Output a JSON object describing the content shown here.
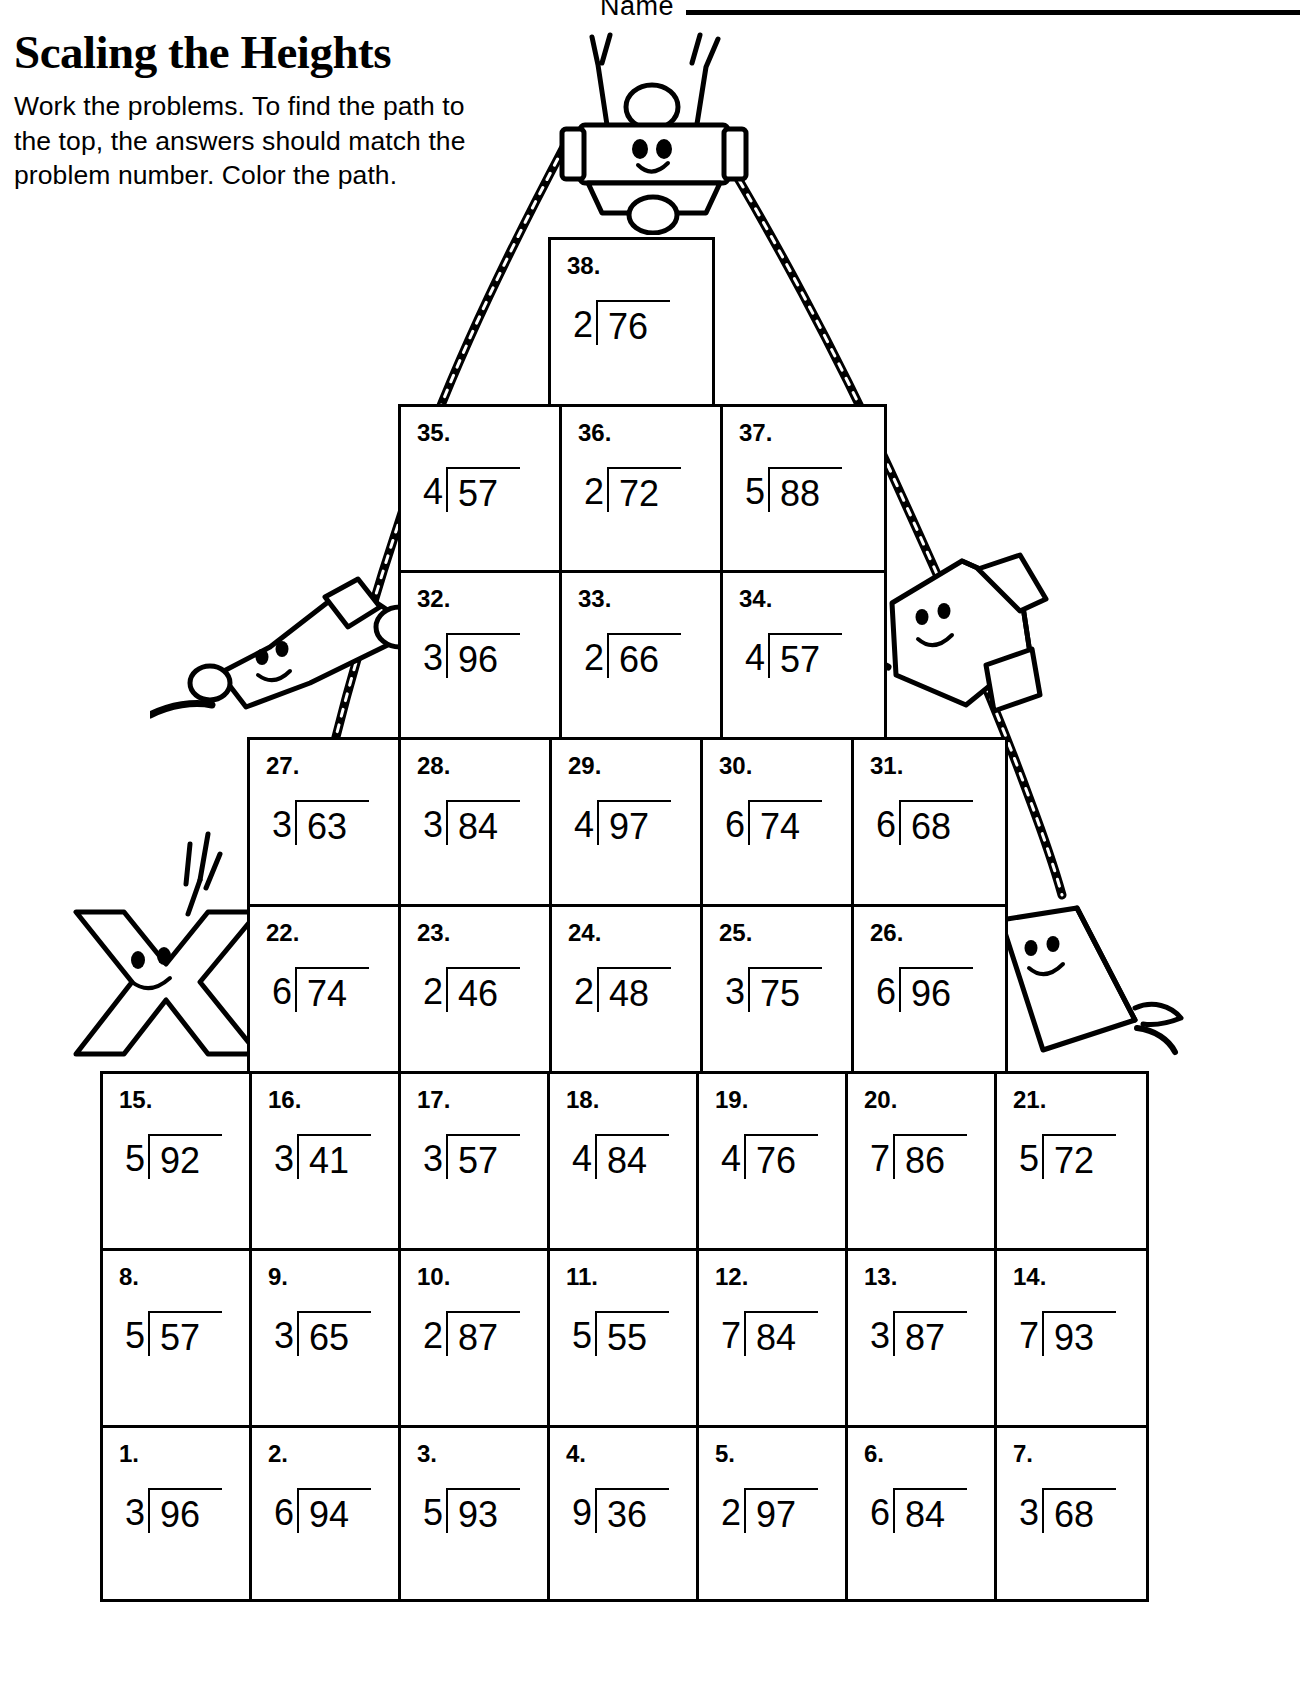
{
  "header": {
    "name_label": "Name",
    "title": "Scaling the Heights",
    "instructions": "Work the problems. To find the path to the top, the answers should match the problem number. Color the path."
  },
  "worksheet": {
    "rows": [
      {
        "id": "row-38",
        "left": 548,
        "top": 237,
        "cell_width": 161,
        "row_height": 172,
        "cells": [
          {
            "number": "38.",
            "divisor": "2",
            "dividend": "76"
          }
        ]
      },
      {
        "id": "row-35-37",
        "left": 398,
        "top": 404,
        "cell_width": 161,
        "row_height": 166,
        "cells": [
          {
            "number": "35.",
            "divisor": "4",
            "dividend": "57"
          },
          {
            "number": "36.",
            "divisor": "2",
            "dividend": "72"
          },
          {
            "number": "37.",
            "divisor": "5",
            "dividend": "88"
          }
        ]
      },
      {
        "id": "row-32-34",
        "left": 398,
        "top": 570,
        "cell_width": 161,
        "row_height": 167,
        "cells": [
          {
            "number": "32.",
            "divisor": "3",
            "dividend": "96"
          },
          {
            "number": "33.",
            "divisor": "2",
            "dividend": "66"
          },
          {
            "number": "34.",
            "divisor": "4",
            "dividend": "57"
          }
        ]
      },
      {
        "id": "row-27-31",
        "left": 247,
        "top": 737,
        "cell_width": 151,
        "row_height": 167,
        "cells": [
          {
            "number": "27.",
            "divisor": "3",
            "dividend": "63"
          },
          {
            "number": "28.",
            "divisor": "3",
            "dividend": "84"
          },
          {
            "number": "29.",
            "divisor": "4",
            "dividend": "97"
          },
          {
            "number": "30.",
            "divisor": "6",
            "dividend": "74"
          },
          {
            "number": "31.",
            "divisor": "6",
            "dividend": "68"
          }
        ]
      },
      {
        "id": "row-22-26",
        "left": 247,
        "top": 904,
        "cell_width": 151,
        "row_height": 167,
        "cells": [
          {
            "number": "22.",
            "divisor": "6",
            "dividend": "74"
          },
          {
            "number": "23.",
            "divisor": "2",
            "dividend": "46"
          },
          {
            "number": "24.",
            "divisor": "2",
            "dividend": "48"
          },
          {
            "number": "25.",
            "divisor": "3",
            "dividend": "75"
          },
          {
            "number": "26.",
            "divisor": "6",
            "dividend": "96"
          }
        ]
      },
      {
        "id": "row-15-21",
        "left": 100,
        "top": 1071,
        "cell_width": 149,
        "row_height": 177,
        "cells": [
          {
            "number": "15.",
            "divisor": "5",
            "dividend": "92"
          },
          {
            "number": "16.",
            "divisor": "3",
            "dividend": "41"
          },
          {
            "number": "17.",
            "divisor": "3",
            "dividend": "57"
          },
          {
            "number": "18.",
            "divisor": "4",
            "dividend": "84"
          },
          {
            "number": "19.",
            "divisor": "4",
            "dividend": "76"
          },
          {
            "number": "20.",
            "divisor": "7",
            "dividend": "86"
          },
          {
            "number": "21.",
            "divisor": "5",
            "dividend": "72"
          }
        ]
      },
      {
        "id": "row-8-14",
        "left": 100,
        "top": 1248,
        "cell_width": 149,
        "row_height": 177,
        "cells": [
          {
            "number": "8.",
            "divisor": "5",
            "dividend": "57"
          },
          {
            "number": "9.",
            "divisor": "3",
            "dividend": "65"
          },
          {
            "number": "10.",
            "divisor": "2",
            "dividend": "87"
          },
          {
            "number": "11.",
            "divisor": "5",
            "dividend": "55"
          },
          {
            "number": "12.",
            "divisor": "7",
            "dividend": "84"
          },
          {
            "number": "13.",
            "divisor": "3",
            "dividend": "87"
          },
          {
            "number": "14.",
            "divisor": "7",
            "dividend": "93"
          }
        ]
      },
      {
        "id": "row-1-7",
        "left": 100,
        "top": 1425,
        "cell_width": 149,
        "row_height": 177,
        "cells": [
          {
            "number": "1.",
            "divisor": "3",
            "dividend": "96"
          },
          {
            "number": "2.",
            "divisor": "6",
            "dividend": "94"
          },
          {
            "number": "3.",
            "divisor": "5",
            "dividend": "93"
          },
          {
            "number": "4.",
            "divisor": "9",
            "dividend": "36"
          },
          {
            "number": "5.",
            "divisor": "2",
            "dividend": "97"
          },
          {
            "number": "6.",
            "divisor": "6",
            "dividend": "84"
          },
          {
            "number": "7.",
            "divisor": "3",
            "dividend": "68"
          }
        ]
      }
    ]
  },
  "illustrations": [
    {
      "name": "crayon-character-top",
      "label": "crayon character cheering at summit"
    },
    {
      "name": "crayon-character-left",
      "label": "crayon character climbing left rope"
    },
    {
      "name": "crayon-character-right",
      "label": "crayon character on right rope"
    },
    {
      "name": "letter-x-character",
      "label": "letter X character waving"
    },
    {
      "name": "eraser-character-right",
      "label": "eraser character on right ledge"
    },
    {
      "name": "rope-left",
      "label": "braided rope left"
    },
    {
      "name": "rope-right",
      "label": "braided rope right"
    }
  ],
  "colors": {
    "ink": "#000000",
    "paper": "#ffffff"
  }
}
